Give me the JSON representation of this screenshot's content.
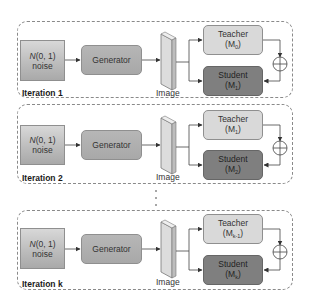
{
  "diagram": {
    "type": "iterative teacher-student distillation pipeline",
    "iterations": [
      {
        "label": "Iteration 1",
        "noise": {
          "dist": "N",
          "params": "(0, 1)",
          "word": "noise"
        },
        "generator": "Generator",
        "image_label": "Image",
        "teacher": {
          "name": "Teacher",
          "model": "M",
          "sub": "0"
        },
        "student": {
          "name": "Student",
          "model": "M",
          "sub": "1"
        },
        "combine_symbol": "⊕"
      },
      {
        "label": "Iteration 2",
        "noise": {
          "dist": "N",
          "params": "(0, 1)",
          "word": "noise"
        },
        "generator": "Generator",
        "image_label": "Image",
        "teacher": {
          "name": "Teacher",
          "model": "M",
          "sub": "1"
        },
        "student": {
          "name": "Student",
          "model": "M",
          "sub": "2"
        },
        "combine_symbol": "⊕"
      },
      {
        "label": "Iteration k",
        "noise": {
          "dist": "N",
          "params": "(0, 1)",
          "word": "noise"
        },
        "generator": "Generator",
        "image_label": "Image",
        "teacher": {
          "name": "Teacher",
          "model": "M",
          "sub": "k-1"
        },
        "student": {
          "name": "Student",
          "model": "M",
          "sub": "k"
        },
        "combine_symbol": "⊕"
      }
    ],
    "ellipsis": "⋮",
    "colors": {
      "frame_border": "#8a8a8a",
      "noise_fill": "#c4c4c4",
      "generator_fill": "#adadad",
      "teacher_fill": "#d9d9d9",
      "student_fill": "#7f7f7f",
      "line": "#444444"
    }
  }
}
